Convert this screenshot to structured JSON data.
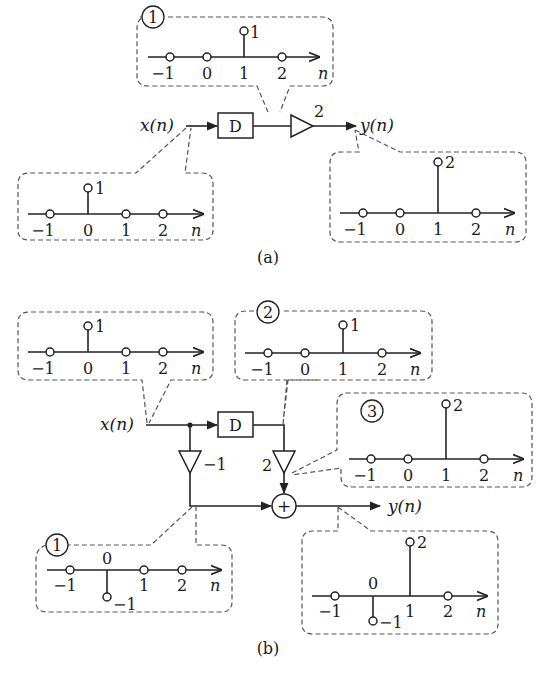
{
  "figure": {
    "part_a": {
      "caption": "(a)",
      "input_label": "x(n)",
      "output_label": "y(n)",
      "delay_label": "D",
      "gain_label": "2",
      "signals": [
        {
          "id": "input",
          "marker": "",
          "n": [
            -1,
            0,
            1,
            2
          ],
          "values": [
            0,
            1,
            0,
            0
          ],
          "value_label": "1",
          "axis_label": "n"
        },
        {
          "id": "node1",
          "marker": "1",
          "n": [
            -1,
            0,
            1,
            2
          ],
          "values": [
            0,
            0,
            1,
            0
          ],
          "value_label": "1",
          "axis_label": "n"
        },
        {
          "id": "output",
          "marker": "",
          "n": [
            -1,
            0,
            1,
            2
          ],
          "values": [
            0,
            0,
            2,
            0
          ],
          "value_label": "2",
          "axis_label": "n"
        }
      ]
    },
    "part_b": {
      "caption": "(b)",
      "input_label": "x(n)",
      "output_label": "y(n)",
      "delay_label": "D",
      "gain_left_label": "−1",
      "gain_right_label": "2",
      "adder_symbol": "+",
      "signals": [
        {
          "id": "input",
          "marker": "",
          "n": [
            -1,
            0,
            1,
            2
          ],
          "values": [
            0,
            1,
            0,
            0
          ],
          "value_label": "1",
          "axis_label": "n"
        },
        {
          "id": "node2",
          "marker": "2",
          "n": [
            -1,
            0,
            1,
            2
          ],
          "values": [
            0,
            0,
            1,
            0
          ],
          "value_label": "1",
          "axis_label": "n"
        },
        {
          "id": "node3",
          "marker": "3",
          "n": [
            -1,
            0,
            1,
            2
          ],
          "values": [
            0,
            0,
            2,
            0
          ],
          "value_label": "2",
          "axis_label": "n"
        },
        {
          "id": "node1",
          "marker": "1",
          "n": [
            -1,
            0,
            1,
            2
          ],
          "values": [
            0,
            -1,
            0,
            0
          ],
          "value_label": "−1",
          "axis_label": "n"
        },
        {
          "id": "output",
          "marker": "",
          "n": [
            -1,
            0,
            1,
            2
          ],
          "values": [
            0,
            -1,
            2,
            0
          ],
          "value_labels": [
            "−1",
            "2"
          ],
          "axis_label": "n"
        }
      ]
    },
    "tick_labels": [
      "−1",
      "0",
      "1",
      "2"
    ]
  }
}
